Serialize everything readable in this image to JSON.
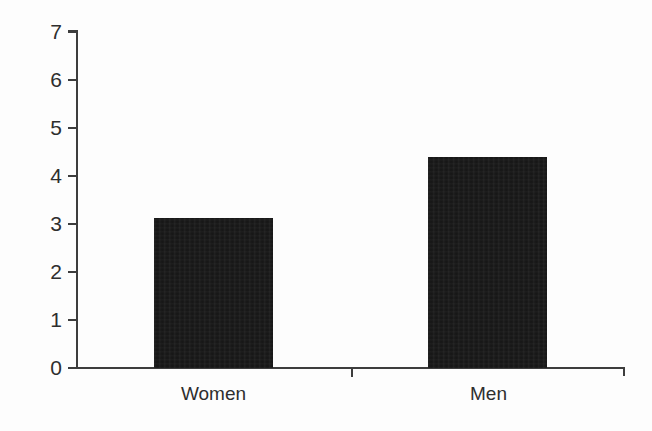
{
  "chart_data": {
    "type": "bar",
    "title": "",
    "subtitle": "",
    "xlabel": "",
    "ylabel": "",
    "categories": [
      "Women",
      "Men"
    ],
    "values": [
      3.12,
      4.4
    ],
    "series": [
      {
        "name": "",
        "values": [
          3.12,
          4.4
        ]
      }
    ],
    "ylim": [
      0,
      7
    ],
    "y_ticks": [
      0,
      1,
      2,
      3,
      4,
      5,
      6,
      7
    ],
    "y_tick_labels": [
      "0",
      "1",
      "2",
      "3",
      "4",
      "5",
      "6",
      "7"
    ],
    "grid": false,
    "legend": false,
    "legend_position": "none",
    "bar_color": "#141414",
    "axis_color": "#3d3d3d",
    "background_color": "#fdfdfd",
    "annotations": []
  }
}
